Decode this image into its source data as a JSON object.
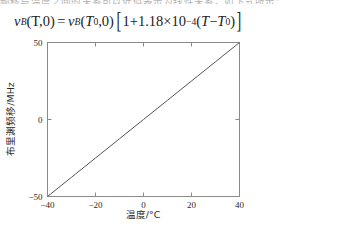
{
  "page": {
    "clipped_top_text": "频移与温度之间的关系可以近似表示为线性关系，如下式所示："
  },
  "equation": {
    "lhs_var": "ν",
    "lhs_sub": "B",
    "lhs_args": "(T,0)",
    "equals": "=",
    "rhs_var": "ν",
    "rhs_sub": "B",
    "rhs_arg_open": "(",
    "rhs_arg_var": "T",
    "rhs_arg_sub": "0",
    "rhs_arg_close": ",0)",
    "bracket_open": "[",
    "one": "1",
    "plus": "+",
    "coefficient": "1.18",
    "times": "×",
    "base": "10",
    "exponent": "−4",
    "delta_open": "(",
    "delta_var": "T",
    "minus": "−",
    "delta_ref_var": "T",
    "delta_ref_sub": "0",
    "delta_close": ")",
    "bracket_close": "]",
    "plain_text": "ν_B(T,0) = ν_B(T_0,0)[1+1.18×10^-4 (T − T_0)]"
  },
  "chart_data": {
    "type": "line",
    "title": "",
    "xlabel": "温度/°C",
    "ylabel": "布里渊频移/MHz",
    "xlim": [
      -40,
      40
    ],
    "ylim": [
      -50,
      50
    ],
    "xticks": [
      -40,
      -20,
      0,
      20,
      40
    ],
    "xtick_labels": [
      "−40",
      "−20",
      "0",
      "20",
      "40"
    ],
    "yticks": [
      -50,
      0,
      50
    ],
    "ytick_labels": [
      "−50",
      "0",
      "50"
    ],
    "grid": false,
    "legend": false,
    "series": [
      {
        "name": "布里渊频移",
        "color": "#555555",
        "x": [
          -40,
          -30,
          -20,
          -10,
          0,
          10,
          20,
          30,
          40
        ],
        "values": [
          -50.0,
          -37.5,
          -25.0,
          -12.5,
          0.0,
          12.5,
          25.0,
          37.5,
          50.0
        ]
      }
    ],
    "axis_color": "#8a8a8a",
    "line_color": "#555555"
  }
}
